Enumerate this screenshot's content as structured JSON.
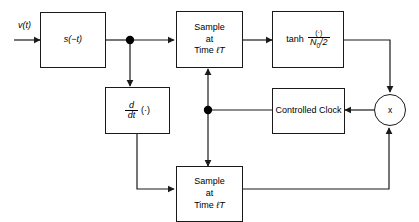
{
  "diagram": {
    "input_label": "v(t)",
    "blocks": {
      "matched_filter": {
        "label": "s(−t)",
        "name": "matched-filter"
      },
      "sample_top": {
        "line1": "Sample",
        "line2": "at",
        "line3_prefix": "Time",
        "line3_var": "ℓT"
      },
      "tanh": {
        "func": "tanh",
        "numerator": "(·)",
        "denominator_symbol": "N",
        "denominator_sub": "0",
        "denominator_rest": "/2"
      },
      "derivative": {
        "numerator": "d",
        "denominator": "dt",
        "argument": "(·)"
      },
      "sample_bottom": {
        "line1": "Sample",
        "line2": "at",
        "line3_prefix": "Time",
        "line3_var": "ℓT"
      },
      "controlled_clock": {
        "line1": "Controlled",
        "line2": "Clock"
      },
      "multiplier": {
        "symbol": "x"
      }
    },
    "colors": {
      "line": "#1a1a1a",
      "text": "#000000",
      "background": "#ffffff",
      "junction": "#000000"
    }
  }
}
